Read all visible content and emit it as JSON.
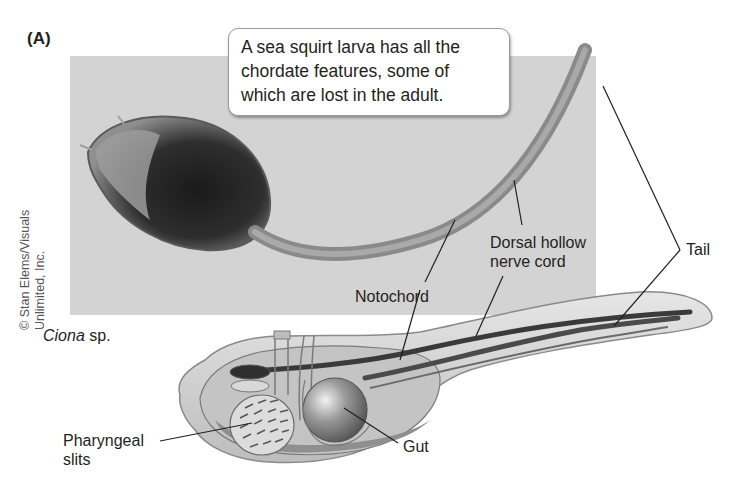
{
  "figure": {
    "panel_label": "(A)",
    "callout": {
      "lines": [
        "A sea squirt larva has all the",
        "chordate features, some of",
        "which are lost in the adult."
      ]
    },
    "photo_credit": {
      "line1": "© Stan Elems/Visuals",
      "line2": "Unlimited, Inc."
    },
    "species": {
      "genus": "Ciona",
      "suffix": " sp."
    },
    "labels": {
      "notochord": "Notochord",
      "nerve_cord_line1": "Dorsal hollow",
      "nerve_cord_line2": "nerve cord",
      "tail": "Tail",
      "pharyngeal_line1": "Pharyngeal",
      "pharyngeal_line2": "slits",
      "gut": "Gut"
    },
    "colors": {
      "photo_background": "#d3d3d3",
      "body_outline": "#8a8a8a",
      "dark_structure": "#3a3a3a",
      "text": "#231f20"
    }
  }
}
